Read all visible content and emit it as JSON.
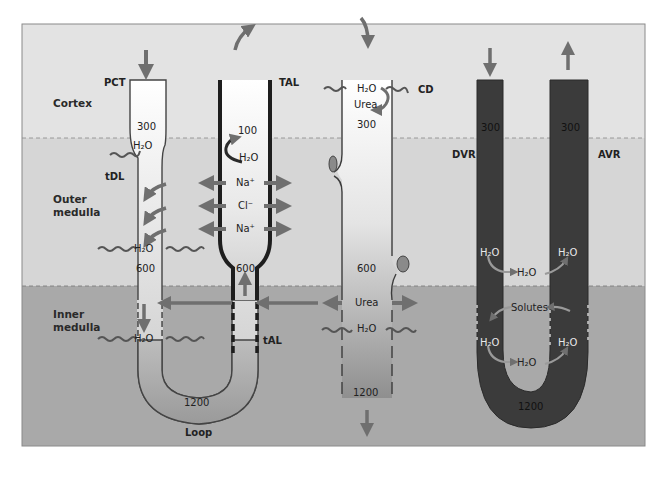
{
  "colors": {
    "cortex_bg": "#e3e3e3",
    "outer_medulla_bg": "#d6d6d6",
    "inner_medulla_bg": "#a8a8a8",
    "panel_border": "#8a8a8a",
    "vessel_dark": "#3a3a3a",
    "arrow_fill": "#7a7a7a",
    "tube_wall": "#3c3c3c"
  },
  "regions": {
    "cortex": "Cortex",
    "outer_medulla": "Outer\nmedulla",
    "inner_medulla": "Inner\nmedulla"
  },
  "nephron": {
    "pct_label": "PCT",
    "tdl_label": "tDL",
    "tal_label": "TAL",
    "tal_thin_label": "tAL",
    "loop_label": "Loop",
    "pct_osm": "300",
    "tdl_osm_mid": "600",
    "loop_osm": "1200",
    "tal_osm_top": "100",
    "tal_osm_bottom": "600",
    "h2o": "H₂O",
    "tal_ions": [
      "Na⁺",
      "Cl⁻",
      "Na⁺"
    ]
  },
  "collecting_duct": {
    "label": "CD",
    "h2o_top": "H₂O",
    "urea_top": "Urea",
    "osm_top": "300",
    "osm_mid": "600",
    "urea_mid": "Urea",
    "h2o_mid": "H₂O",
    "osm_bottom": "1200"
  },
  "vasa_recta": {
    "dvr_label": "DVR",
    "avr_label": "AVR",
    "dvr_osm": "300",
    "avr_osm": "300",
    "loop_osm": "1200",
    "h2o": "H₂O",
    "solutes": "Solutes"
  }
}
